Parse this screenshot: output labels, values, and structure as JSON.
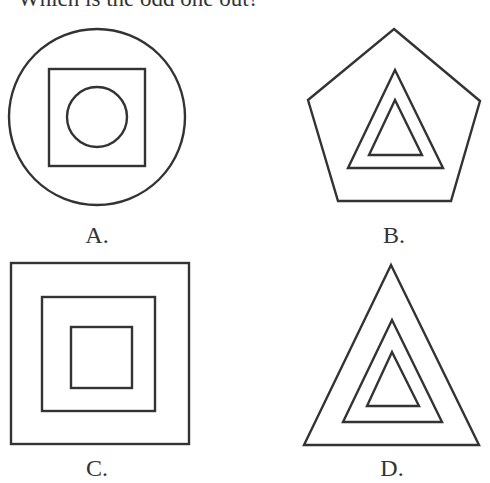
{
  "question": {
    "text": "Which is the odd one out?"
  },
  "options": [
    {
      "label": "A.",
      "description": "Circle containing a square containing a circle",
      "shapes": [
        "circle",
        "square",
        "circle"
      ]
    },
    {
      "label": "B.",
      "description": "Pentagon containing a triangle containing a triangle",
      "shapes": [
        "pentagon",
        "triangle",
        "triangle"
      ]
    },
    {
      "label": "C.",
      "description": "Square containing a square containing a square",
      "shapes": [
        "square",
        "square",
        "square"
      ]
    },
    {
      "label": "D.",
      "description": "Triangle containing a triangle containing a triangle",
      "shapes": [
        "triangle",
        "triangle",
        "triangle"
      ]
    }
  ],
  "style": {
    "stroke_color": "#333333",
    "background": "#ffffff"
  }
}
